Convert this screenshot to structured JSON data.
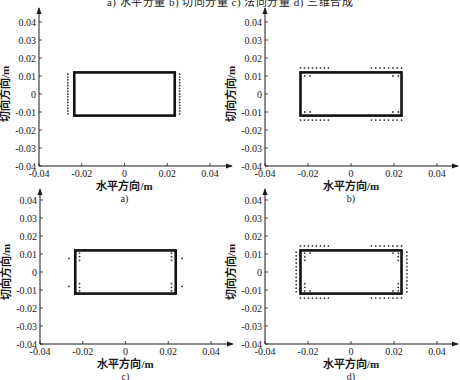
{
  "figure": {
    "top_caption": "a) 水平分量   b) 切向分量   c) 法向分量   d) 三维合成"
  },
  "chart_data": [
    {
      "id": "a",
      "type": "scatter",
      "label": "a)",
      "title": "水平分量",
      "xlabel": "水平方向/m",
      "ylabel": "切向方向/m",
      "xlim": [
        -0.04,
        0.04
      ],
      "ylim": [
        -0.04,
        0.04
      ],
      "xticks": [
        "-0.04",
        "-0.02",
        "0",
        "0.02",
        "0.04"
      ],
      "yticks": [
        "0.04",
        "0.03",
        "0.02",
        "0.01",
        "0",
        "-0.01",
        "-0.02",
        "-0.03",
        "-0.04"
      ],
      "rectangle": {
        "x": [
          -0.0235,
          0.0235
        ],
        "y": [
          -0.012,
          0.012
        ]
      },
      "point_groups": [
        {
          "desc": "left outer column",
          "x": -0.0265,
          "y_from": -0.011,
          "y_to": 0.011,
          "count": 15
        },
        {
          "desc": "right outer column",
          "x": 0.0258,
          "y_from": -0.011,
          "y_to": 0.011,
          "count": 15
        }
      ],
      "grid": false
    },
    {
      "id": "b",
      "type": "scatter",
      "label": "b)",
      "title": "切向分量",
      "xlabel": "水平方向/m",
      "ylabel": "切向方向/m",
      "xlim": [
        -0.04,
        0.04
      ],
      "ylim": [
        -0.04,
        0.04
      ],
      "xticks": [
        "-0.04",
        "-0.02",
        "0",
        "0.02",
        "0.04"
      ],
      "yticks": [
        "0.04",
        "0.03",
        "0.02",
        "0.01",
        "0",
        "-0.01",
        "-0.02",
        "-0.03",
        "-0.04"
      ],
      "rectangle": {
        "x": [
          -0.0235,
          0.0235
        ],
        "y": [
          -0.012,
          0.012
        ]
      },
      "point_groups": [
        {
          "desc": "top-left outer row",
          "y": 0.0145,
          "x_from": -0.0235,
          "x_to": -0.0105,
          "count": 8
        },
        {
          "desc": "top-right outer row",
          "y": 0.0145,
          "x_from": 0.0095,
          "x_to": 0.0235,
          "count": 8
        },
        {
          "desc": "bottom-left outer row",
          "y": -0.0145,
          "x_from": -0.0235,
          "x_to": -0.0105,
          "count": 8
        },
        {
          "desc": "bottom-right outer row",
          "y": -0.0145,
          "x_from": 0.0095,
          "x_to": 0.0235,
          "count": 8
        },
        {
          "desc": "inner corner pairs",
          "points": [
            [
              -0.0215,
              0.01
            ],
            [
              -0.019,
              0.01
            ],
            [
              0.0195,
              0.01
            ],
            [
              0.022,
              0.01
            ],
            [
              -0.0215,
              -0.01
            ],
            [
              -0.019,
              -0.01
            ],
            [
              0.0195,
              -0.01
            ],
            [
              0.022,
              -0.01
            ]
          ]
        }
      ],
      "grid": false
    },
    {
      "id": "c",
      "type": "scatter",
      "label": "c)",
      "title": "法向分量",
      "xlabel": "水平方向/m",
      "ylabel": "切向方向/m",
      "xlim": [
        -0.04,
        0.04
      ],
      "ylim": [
        -0.04,
        0.04
      ],
      "xticks": [
        "-0.04",
        "-0.02",
        "0",
        "0.02",
        "0.04"
      ],
      "yticks": [
        "0.04",
        "0.03",
        "0.02",
        "0.01",
        "0",
        "-0.01",
        "-0.02",
        "-0.03",
        "-0.04"
      ],
      "rectangle": {
        "x": [
          -0.0235,
          0.0235
        ],
        "y": [
          -0.012,
          0.012
        ]
      },
      "point_groups": [
        {
          "desc": "inner columns",
          "points": [
            [
              -0.0215,
              0.0105
            ],
            [
              -0.0215,
              0.0085
            ],
            [
              -0.0215,
              0.0065
            ],
            [
              -0.0215,
              -0.0065
            ],
            [
              -0.0215,
              -0.0085
            ],
            [
              -0.0215,
              -0.0105
            ],
            [
              0.0215,
              0.0105
            ],
            [
              0.0215,
              0.0085
            ],
            [
              0.0215,
              0.0065
            ],
            [
              0.0215,
              -0.0065
            ],
            [
              0.0215,
              -0.0085
            ],
            [
              0.0215,
              -0.0105
            ]
          ]
        },
        {
          "desc": "outer singles",
          "points": [
            [
              -0.0265,
              0.0075
            ],
            [
              -0.0265,
              -0.008
            ],
            [
              0.0265,
              0.0075
            ],
            [
              0.0265,
              -0.008
            ]
          ]
        }
      ],
      "grid": false
    },
    {
      "id": "d",
      "type": "scatter",
      "label": "d)",
      "title": "三维合成",
      "xlabel": "水平方向/m",
      "ylabel": "切向方向/m",
      "xlim": [
        -0.04,
        0.04
      ],
      "ylim": [
        -0.04,
        0.04
      ],
      "xticks": [
        "-0.04",
        "-0.02",
        "0",
        "0.02",
        "0.04"
      ],
      "yticks": [
        "0.04",
        "0.03",
        "0.02",
        "0.01",
        "0",
        "-0.01",
        "-0.02",
        "-0.03",
        "-0.04"
      ],
      "rectangle": {
        "x": [
          -0.0235,
          0.0235
        ],
        "y": [
          -0.012,
          0.012
        ]
      },
      "point_groups": [
        {
          "desc": "top-left outer row",
          "y": 0.0145,
          "x_from": -0.0235,
          "x_to": -0.0105,
          "count": 8
        },
        {
          "desc": "top-right outer row",
          "y": 0.0145,
          "x_from": 0.0095,
          "x_to": 0.0235,
          "count": 8
        },
        {
          "desc": "bottom-left outer row",
          "y": -0.0145,
          "x_from": -0.0235,
          "x_to": -0.0105,
          "count": 8
        },
        {
          "desc": "bottom-right outer row",
          "y": -0.0145,
          "x_from": 0.0095,
          "x_to": 0.0235,
          "count": 8
        },
        {
          "desc": "left outer column",
          "x": -0.0255,
          "y_from": -0.011,
          "y_to": 0.011,
          "count": 12
        },
        {
          "desc": "right outer column",
          "x": 0.026,
          "y_from": -0.011,
          "y_to": 0.011,
          "count": 12
        },
        {
          "desc": "inner corners",
          "points": [
            [
              -0.0215,
              0.0105
            ],
            [
              -0.019,
              0.0105
            ],
            [
              -0.0215,
              0.0085
            ],
            [
              -0.0215,
              0.0065
            ],
            [
              0.0195,
              0.0105
            ],
            [
              0.022,
              0.0105
            ],
            [
              0.022,
              0.0085
            ],
            [
              0.022,
              0.0065
            ],
            [
              -0.0215,
              -0.0105
            ],
            [
              -0.019,
              -0.0105
            ],
            [
              -0.0215,
              -0.0085
            ],
            [
              -0.0215,
              -0.0065
            ],
            [
              0.0195,
              -0.0105
            ],
            [
              0.022,
              -0.0105
            ],
            [
              0.022,
              -0.0085
            ],
            [
              0.022,
              -0.0065
            ]
          ]
        }
      ],
      "grid": false
    }
  ]
}
